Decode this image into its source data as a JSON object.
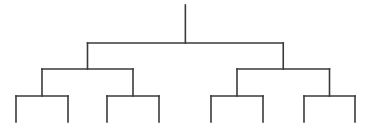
{
  "diagram": {
    "type": "binary-tree",
    "line_color": "#3a3a3a",
    "background": "#ffffff",
    "depth": 3,
    "leaf_count": 8,
    "labels": [],
    "root": {
      "id": "root",
      "children": [
        {
          "id": "L",
          "children": [
            {
              "id": "LL",
              "children": [
                {
                  "id": "LLL"
                },
                {
                  "id": "LLR"
                }
              ]
            },
            {
              "id": "LR",
              "children": [
                {
                  "id": "LRL"
                },
                {
                  "id": "LRR"
                }
              ]
            }
          ]
        },
        {
          "id": "R",
          "children": [
            {
              "id": "RL",
              "children": [
                {
                  "id": "RLL"
                },
                {
                  "id": "RLR"
                }
              ]
            },
            {
              "id": "RR",
              "children": [
                {
                  "id": "RRL"
                },
                {
                  "id": "RRR"
                }
              ]
            }
          ]
        }
      ]
    }
  }
}
